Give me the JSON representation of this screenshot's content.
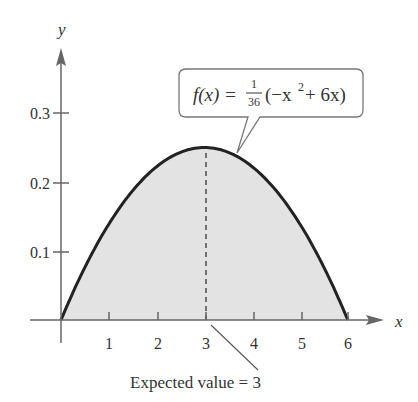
{
  "chart_data": {
    "type": "area",
    "title": "",
    "function": "f(x) = (1/36)(-x^2 + 6x)",
    "xlabel": "x",
    "ylabel": "y",
    "xlim": [
      0,
      6
    ],
    "ylim": [
      0,
      0.3
    ],
    "x_ticks": [
      "1",
      "2",
      "3",
      "4",
      "5",
      "6"
    ],
    "y_ticks": [
      "0.1",
      "0.2",
      "0.3"
    ],
    "x": [
      0,
      0.5,
      1,
      1.5,
      2,
      2.5,
      3,
      3.5,
      4,
      4.5,
      5,
      5.5,
      6
    ],
    "values": [
      0,
      0.0764,
      0.1389,
      0.1875,
      0.2222,
      0.2431,
      0.25,
      0.2431,
      0.2222,
      0.1875,
      0.1389,
      0.0764,
      0
    ],
    "annotations": [
      {
        "text": "f(x) = 1/36(−x² + 6x)",
        "points_to": [
          3.6,
          0.24
        ]
      },
      {
        "text": "Expected value = 3",
        "points_to": [
          3,
          0
        ]
      }
    ],
    "grid": false,
    "legend": "none"
  },
  "labels": {
    "y_axis": "y",
    "x_axis": "x",
    "callout_fx": "f(x) = ",
    "callout_num": "1",
    "callout_den": "36",
    "callout_paren": "(−x",
    "callout_exp": "2",
    "callout_rest": " + 6x)",
    "expected": "Expected value = 3"
  }
}
